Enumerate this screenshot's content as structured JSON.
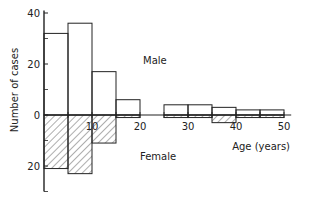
{
  "chart_data": {
    "type": "bar",
    "subtype": "back-to-back histogram",
    "title": "",
    "xlabel": "Age (years)",
    "ylabel": "Number of cases",
    "xlim": [
      0,
      50
    ],
    "ylim": [
      -25,
      40
    ],
    "x_ticks": [
      10,
      20,
      30,
      40,
      50
    ],
    "x_tick_labels": [
      "10",
      "20",
      "30",
      "40",
      "50"
    ],
    "y_ticks": [
      -20,
      0,
      20,
      40
    ],
    "y_tick_labels": [
      "20",
      "0",
      "20",
      "40"
    ],
    "y_minor_ticks": [
      -30,
      -10,
      10,
      30
    ],
    "grid": false,
    "annotations": [
      "Male",
      "Female"
    ],
    "bins": [
      {
        "from": 0,
        "to": 5
      },
      {
        "from": 5,
        "to": 10
      },
      {
        "from": 10,
        "to": 15
      },
      {
        "from": 15,
        "to": 20
      },
      {
        "from": 25,
        "to": 30
      },
      {
        "from": 30,
        "to": 35
      },
      {
        "from": 35,
        "to": 40
      },
      {
        "from": 40,
        "to": 45
      },
      {
        "from": 45,
        "to": 50
      }
    ],
    "series": [
      {
        "name": "Male",
        "direction": "up",
        "fill": "none",
        "values": [
          32,
          36,
          17,
          6,
          4,
          4,
          3,
          2,
          2
        ]
      },
      {
        "name": "Female",
        "direction": "down",
        "fill": "hatched",
        "values": [
          21,
          23,
          11,
          1,
          1,
          1,
          3,
          1,
          1
        ]
      }
    ]
  },
  "colors": {
    "line": "#222222",
    "background": "#ffffff"
  }
}
